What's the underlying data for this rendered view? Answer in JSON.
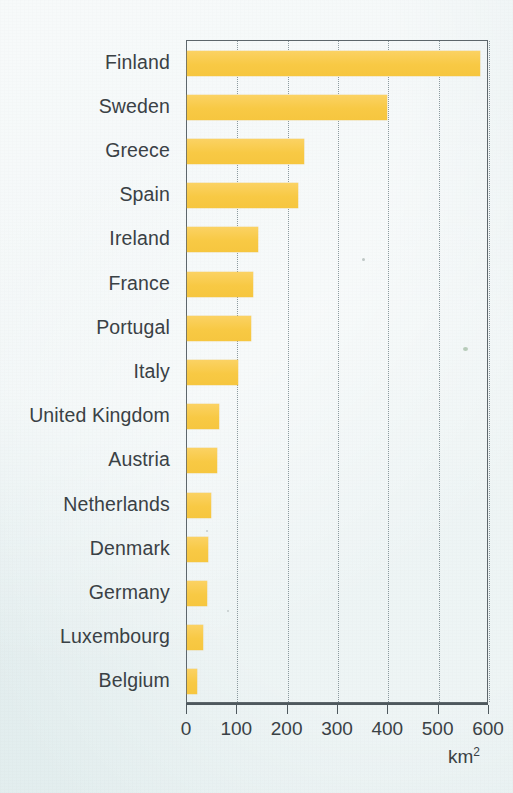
{
  "chart_data": {
    "type": "bar",
    "orientation": "horizontal",
    "title": "",
    "subtitle": "",
    "xlabel": "km²",
    "ylabel": "",
    "xlim": [
      0,
      600
    ],
    "xticks": [
      0,
      100,
      200,
      300,
      400,
      500,
      600
    ],
    "xtick_labels": [
      "0",
      "100",
      "200",
      "300",
      "400",
      "500",
      "600"
    ],
    "grid": "vertical-dotted",
    "legend": "none",
    "bar_color": "#f9cc52",
    "background_color": "#e9f1f2",
    "axis_color": "#4e585d",
    "text_color": "#3a4145",
    "categories": [
      "Finland",
      "Sweden",
      "Greece",
      "Spain",
      "Ireland",
      "France",
      "Portugal",
      "Italy",
      "United Kingdom",
      "Austria",
      "Netherlands",
      "Denmark",
      "Germany",
      "Luxembourg",
      "Belgium"
    ],
    "values": [
      582,
      398,
      233,
      220,
      141,
      131,
      127,
      102,
      63,
      59,
      47,
      41,
      39,
      31,
      20
    ],
    "unit": "km²"
  },
  "axis": {
    "unit_base": "km",
    "unit_exponent": "2"
  }
}
